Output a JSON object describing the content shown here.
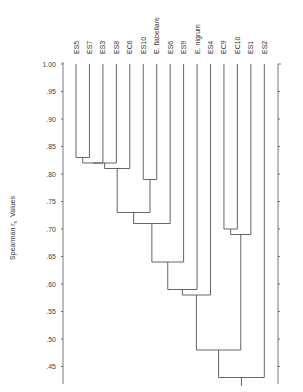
{
  "chart_data": {
    "type": "dendrogram",
    "title": "",
    "xlabel": "",
    "ylabel": "Spearman r_s Values",
    "ylabel_main": "Spearman r",
    "ylabel_sub": "s",
    "ylabel_tail": "Values",
    "ylim": [
      0.43,
      1.0
    ],
    "yticks": [
      1.0,
      0.95,
      0.9,
      0.85,
      0.8,
      0.75,
      0.7,
      0.65,
      0.6,
      0.55,
      0.5,
      0.45
    ],
    "ytick_labels": [
      "1.00",
      ".95",
      ".90",
      ".85",
      ".80",
      ".75",
      ".70",
      ".65",
      ".60",
      ".55",
      ".50",
      ".45"
    ],
    "leaves": [
      "ES5",
      "ES7",
      "ES3",
      "ES8",
      "EC6",
      "ES10",
      "E. flabellare",
      "ES6",
      "ES9",
      "E. nigrum",
      "ES4",
      "EC9",
      "EC10",
      "ES1",
      "ES2"
    ],
    "merges": [
      {
        "left": "ES5",
        "right": "ES7",
        "value": 0.83
      },
      {
        "left": "ES5+ES7",
        "right": "ES3",
        "value": 0.82
      },
      {
        "left": "ES5+ES7+ES3",
        "right": "ES8",
        "value": 0.82
      },
      {
        "left": "ES5..ES8",
        "right": "EC6",
        "value": 0.81
      },
      {
        "left": "ES10",
        "right": "E. flabellare",
        "value": 0.79
      },
      {
        "left": "ES5..EC6",
        "right": "ES10+E. flabellare",
        "value": 0.73
      },
      {
        "left": "cluster",
        "right": "ES6",
        "value": 0.71
      },
      {
        "left": "cluster",
        "right": "ES9",
        "value": 0.64
      },
      {
        "left": "cluster",
        "right": "E. nigrum",
        "value": 0.59
      },
      {
        "left": "cluster",
        "right": "ES4",
        "value": 0.58
      },
      {
        "left": "EC9",
        "right": "EC10",
        "value": 0.7
      },
      {
        "left": "EC9+EC10",
        "right": "ES1",
        "value": 0.69
      },
      {
        "left": "cluster",
        "right": "EC9+EC10+ES1",
        "value": 0.48
      },
      {
        "left": "cluster",
        "right": "ES2",
        "value": 0.43
      }
    ],
    "grid": false,
    "legend": null
  }
}
